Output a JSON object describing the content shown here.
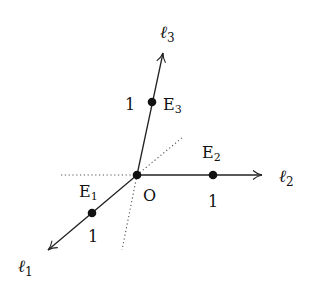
{
  "diagram": {
    "origin": {
      "label": "O"
    },
    "axes": [
      {
        "name": "ℓ",
        "sub": "1",
        "unit_point": "E",
        "unit_point_sub": "1",
        "unit_label": "1"
      },
      {
        "name": "ℓ",
        "sub": "2",
        "unit_point": "E",
        "unit_point_sub": "2",
        "unit_label": "1"
      },
      {
        "name": "ℓ",
        "sub": "3",
        "unit_point": "E",
        "unit_point_sub": "3",
        "unit_label": "1"
      }
    ],
    "colors": {
      "line": "#222222",
      "dots": "#111111",
      "dotted": "#555555"
    }
  }
}
